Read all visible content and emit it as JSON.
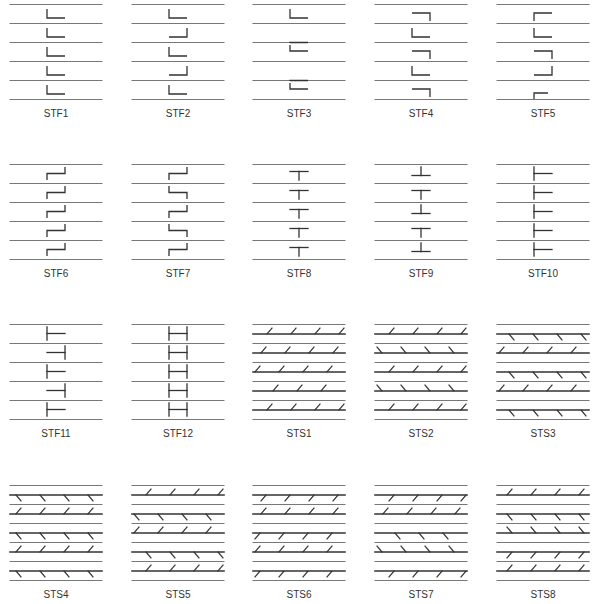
{
  "figure": {
    "columns_x": [
      10,
      132,
      253,
      375,
      497
    ],
    "panel_width": 92,
    "rows_top": [
      4,
      164,
      324,
      485
    ],
    "line_spacing": 19,
    "label_offset": 104,
    "colors": {
      "line": "#777777",
      "thick": "#333333",
      "symbol": "#333333",
      "label": "#333333"
    }
  },
  "panels": [
    {
      "label": "STF1",
      "type": "stf",
      "symbols": [
        {
          "g": 0,
          "k": "L_bl"
        },
        {
          "g": 1,
          "k": "L_bl"
        },
        {
          "g": 2,
          "k": "L_bl"
        },
        {
          "g": 3,
          "k": "L_bl"
        },
        {
          "g": 4,
          "k": "L_bl"
        }
      ]
    },
    {
      "label": "STF2",
      "type": "stf",
      "symbols": [
        {
          "g": 0,
          "k": "L_bl"
        },
        {
          "g": 1,
          "k": "L_br"
        },
        {
          "g": 2,
          "k": "L_bl"
        },
        {
          "g": 3,
          "k": "L_br"
        },
        {
          "g": 4,
          "k": "L_bl"
        }
      ]
    },
    {
      "label": "STF3",
      "type": "stf",
      "symbols": [
        {
          "g": 0,
          "k": "L_bl"
        },
        {
          "g": 1,
          "k": "G_tl"
        },
        {
          "g": 1.5,
          "k": "L_bl_at"
        },
        {
          "g": 3,
          "k": "G_tl"
        },
        {
          "g": 3.5,
          "k": "L_bl_at"
        }
      ]
    },
    {
      "label": "STF4",
      "type": "stf",
      "symbols": [
        {
          "g": 0.5,
          "k": "G_tr_at"
        },
        {
          "g": 1,
          "k": "L_bl"
        },
        {
          "g": 2.5,
          "k": "G_tr_at"
        },
        {
          "g": 3,
          "k": "L_bl"
        },
        {
          "g": 4.5,
          "k": "G_tr_at"
        }
      ]
    },
    {
      "label": "STF5",
      "type": "stf",
      "symbols": [
        {
          "g": 0.5,
          "k": "G_tl_at"
        },
        {
          "g": 1,
          "k": "L_bl"
        },
        {
          "g": 2.5,
          "k": "G_tr_at"
        },
        {
          "g": 3,
          "k": "L_br"
        },
        {
          "g": 4.5,
          "k": "G_tl_short"
        }
      ]
    },
    {
      "label": "STF6",
      "type": "stf",
      "symbols": [
        {
          "g": 0,
          "k": "Z"
        },
        {
          "g": 1,
          "k": "Z"
        },
        {
          "g": 2,
          "k": "Z"
        },
        {
          "g": 3,
          "k": "Z"
        },
        {
          "g": 4,
          "k": "Z"
        }
      ]
    },
    {
      "label": "STF7",
      "type": "stf",
      "symbols": [
        {
          "g": 0,
          "k": "Z"
        },
        {
          "g": 1,
          "k": "S"
        },
        {
          "g": 2,
          "k": "Z"
        },
        {
          "g": 3,
          "k": "S"
        },
        {
          "g": 4,
          "k": "Z"
        }
      ]
    },
    {
      "label": "STF8",
      "type": "stf",
      "symbols": [
        {
          "g": 0,
          "k": "T"
        },
        {
          "g": 1,
          "k": "T"
        },
        {
          "g": 2,
          "k": "T"
        },
        {
          "g": 3,
          "k": "T"
        },
        {
          "g": 4,
          "k": "T"
        }
      ]
    },
    {
      "label": "STF9",
      "type": "stf",
      "symbols": [
        {
          "g": 0,
          "k": "INV_T"
        },
        {
          "g": 1,
          "k": "T"
        },
        {
          "g": 2,
          "k": "INV_T"
        },
        {
          "g": 3,
          "k": "T"
        },
        {
          "g": 4,
          "k": "INV_T"
        }
      ]
    },
    {
      "label": "STF10",
      "type": "stf",
      "symbols": [
        {
          "g": 0,
          "k": "TL"
        },
        {
          "g": 1,
          "k": "TL"
        },
        {
          "g": 2,
          "k": "TL"
        },
        {
          "g": 3,
          "k": "TL"
        },
        {
          "g": 4,
          "k": "TL"
        }
      ]
    },
    {
      "label": "STF11",
      "type": "stf",
      "symbols": [
        {
          "g": 0,
          "k": "TL"
        },
        {
          "g": 1,
          "k": "TR"
        },
        {
          "g": 2,
          "k": "TL"
        },
        {
          "g": 3,
          "k": "TR"
        },
        {
          "g": 4,
          "k": "TL"
        }
      ]
    },
    {
      "label": "STF12",
      "type": "stf",
      "symbols": [
        {
          "g": 0,
          "k": "H"
        },
        {
          "g": 1,
          "k": "H"
        },
        {
          "g": 2,
          "k": "H"
        },
        {
          "g": 3,
          "k": "H"
        },
        {
          "g": 4,
          "k": "H"
        }
      ]
    },
    {
      "label": "STS1",
      "type": "sts",
      "hatches": [
        {
          "t": 0,
          "d": "/",
          "s": "above",
          "x0": 14
        },
        {
          "t": 1,
          "d": "/",
          "s": "above",
          "x0": 8
        },
        {
          "t": 2,
          "d": "/",
          "s": "above",
          "x0": 2
        },
        {
          "t": 3,
          "d": "/",
          "s": "above",
          "x0": 20
        },
        {
          "t": 4,
          "d": "/",
          "s": "above",
          "x0": 14
        }
      ]
    },
    {
      "label": "STS2",
      "type": "sts",
      "hatches": [
        {
          "t": 0,
          "d": "/",
          "s": "above",
          "x0": 14
        },
        {
          "t": 1,
          "d": "\\",
          "s": "above",
          "x0": 2
        },
        {
          "t": 2,
          "d": "/",
          "s": "above",
          "x0": 14
        },
        {
          "t": 3,
          "d": "\\",
          "s": "above",
          "x0": 2
        },
        {
          "t": 4,
          "d": "/",
          "s": "above",
          "x0": 14
        }
      ]
    },
    {
      "label": "STS3",
      "type": "sts",
      "hatches": [
        {
          "t": 0,
          "d": "\\",
          "s": "below",
          "x0": 12
        },
        {
          "t": 1,
          "d": "/",
          "s": "above",
          "x0": 2
        },
        {
          "t": 2,
          "d": "\\",
          "s": "below",
          "x0": 12
        },
        {
          "t": 3,
          "d": "/",
          "s": "above",
          "x0": 2
        },
        {
          "t": 4,
          "d": "\\",
          "s": "below",
          "x0": 12
        }
      ]
    },
    {
      "label": "STS4",
      "type": "sts",
      "hatches": [
        {
          "t": 0,
          "d": "\\",
          "s": "below",
          "x0": 6
        },
        {
          "t": 1,
          "d": "/",
          "s": "above",
          "x0": 6
        },
        {
          "t": 2,
          "d": "\\",
          "s": "below",
          "x0": 6
        },
        {
          "t": 3,
          "d": "/",
          "s": "above",
          "x0": 6
        },
        {
          "t": 4,
          "d": "\\",
          "s": "below",
          "x0": 6
        }
      ]
    },
    {
      "label": "STS5",
      "type": "sts",
      "hatches": [
        {
          "t": 0,
          "d": "/",
          "s": "above",
          "x0": 14
        },
        {
          "t": 1,
          "d": "\\",
          "s": "below",
          "x0": 2
        },
        {
          "t": 2,
          "d": "/",
          "s": "above",
          "x0": 2
        },
        {
          "t": 3,
          "d": "\\",
          "s": "below",
          "x0": 14
        },
        {
          "t": 4,
          "d": "/",
          "s": "above",
          "x0": 14
        }
      ]
    },
    {
      "label": "STS6",
      "type": "sts",
      "hatches": [
        {
          "t": 0,
          "d": "/",
          "s": "below",
          "x0": 8
        },
        {
          "t": 1,
          "d": "/",
          "s": "above",
          "x0": 8
        },
        {
          "t": 2,
          "d": "/",
          "s": "below",
          "x0": 2
        },
        {
          "t": 3,
          "d": "/",
          "s": "above",
          "x0": 2
        },
        {
          "t": 4,
          "d": "/",
          "s": "below",
          "x0": 2
        }
      ]
    },
    {
      "label": "STS7",
      "type": "sts",
      "hatches": [
        {
          "t": 0,
          "d": "/",
          "s": "below",
          "x0": 14
        },
        {
          "t": 1,
          "d": "/",
          "s": "above",
          "x0": 8
        },
        {
          "t": 2,
          "d": "\\",
          "s": "below",
          "x0": 20
        },
        {
          "t": 3,
          "d": "\\",
          "s": "above",
          "x0": 2
        },
        {
          "t": 4,
          "d": "/",
          "s": "below",
          "x0": 14
        }
      ]
    },
    {
      "label": "STS8",
      "type": "sts",
      "hatches": [
        {
          "t": 0,
          "d": "/",
          "s": "above",
          "x0": 10
        },
        {
          "t": 1,
          "d": "\\",
          "s": "below",
          "x0": 10
        },
        {
          "t": 2,
          "d": "\\",
          "s": "above",
          "x0": 10
        },
        {
          "t": 3,
          "d": "/",
          "s": "below",
          "x0": 10
        },
        {
          "t": 4,
          "d": "/",
          "s": "above",
          "x0": 10
        }
      ]
    }
  ]
}
